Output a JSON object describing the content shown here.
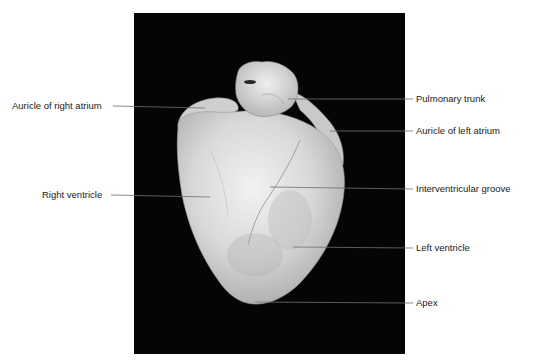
{
  "figure": {
    "labels": {
      "auricle_right_atrium": "Auricle of right atrium",
      "right_ventricle": "Right ventricle",
      "pulmonary_trunk": "Pulmonary trunk",
      "auricle_left_atrium": "Auricle of left atrium",
      "interventricular_groove": "Interventricular groove",
      "left_ventricle": "Left ventricle",
      "apex": "Apex"
    },
    "colors": {
      "background": "#ffffff",
      "photo_background": "#050505",
      "leader_line": "#6e6e6e",
      "label_text": "#1a1a1a"
    }
  }
}
